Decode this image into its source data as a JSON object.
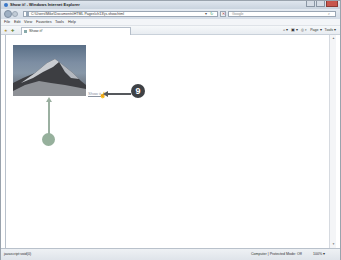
{
  "window": {
    "title": "Show it! - Windows Internet Explorer"
  },
  "navbar": {
    "url": "C:\\Users\\Mike\\Documents\\HTML Pages\\ch13\\js-show.html",
    "dropdown_glyph": "▾",
    "refresh_glyph": "↻",
    "stop_glyph": "✕",
    "search_placeholder": "Google",
    "search_glyph": "⌕"
  },
  "menubar": {
    "items": [
      "File",
      "Edit",
      "View",
      "Favorites",
      "Tools",
      "Help"
    ]
  },
  "favbar": {
    "tab_label": "Show it!",
    "commands": [
      "⌂ ▾",
      "▣ ▾",
      "⎙ ▾",
      "Page ▾",
      "Tools ▾"
    ]
  },
  "content": {
    "image_alt": "Mountain peak photo",
    "link_text": "Show it",
    "cursor_glyph": "☝"
  },
  "callouts": {
    "badge_number": "9",
    "badge_color": "#3e4145",
    "secondary_color": "#96b09c"
  },
  "statusbar": {
    "status_text": "javascript:void(0)",
    "zone_text": "Computer | Protected Mode: Off",
    "zoom_level": "100% ▾"
  },
  "scrollbar": {
    "up_glyph": "▲",
    "down_glyph": "▼"
  }
}
